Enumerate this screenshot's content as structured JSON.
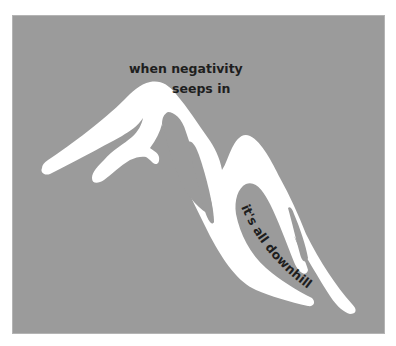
{
  "illustration": {
    "subject": "mountain",
    "background_color": "#9b9b9b",
    "mountain_color": "#ffffff",
    "text_color": "#1e1e1e",
    "captions": {
      "top_line1": "when negativity",
      "top_line2": "seeps in",
      "slope": "it's all downhill"
    }
  }
}
